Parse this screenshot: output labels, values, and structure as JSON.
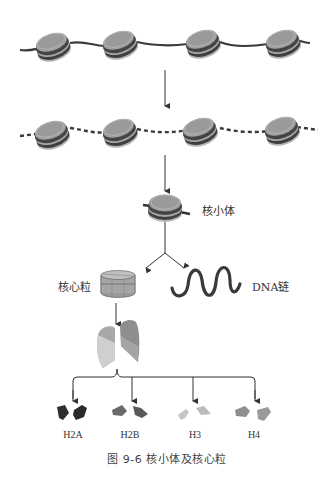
{
  "figure": {
    "caption": "图 9-6   核小体及核心粒",
    "labels": {
      "nucleosome": "核小体",
      "core_particle": "核心粒",
      "dna_strand": "DNA链"
    },
    "histones": [
      {
        "name": "H2A",
        "color": "#2f2f2f"
      },
      {
        "name": "H2B",
        "color": "#6a6a6a"
      },
      {
        "name": "H3",
        "color": "#c4c4c4"
      },
      {
        "name": "H4",
        "color": "#8f8f8f"
      }
    ],
    "stages": [
      "chromatin fiber with nucleosomes on continuous DNA",
      "nucleosomes with linker DNA cut (dashed)",
      "single nucleosome",
      "core particle + DNA strand",
      "histone octamer dissociated",
      "histone pairs H2A, H2B, H3, H4"
    ],
    "colors": {
      "dna": "#3a3a3a",
      "histone_disc": "#9a9a9a",
      "histone_band": "#4a4a4a",
      "arrow": "#333333"
    }
  }
}
